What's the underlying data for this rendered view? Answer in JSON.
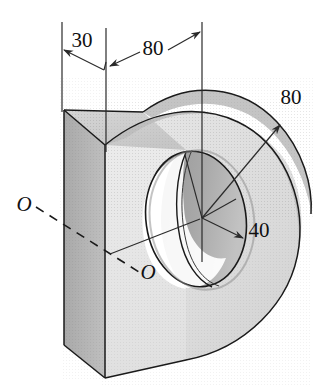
{
  "figure": {
    "name": "isometric-d-plate-with-through-hole",
    "background_color": "#ffffff",
    "width": 323,
    "height": 389
  },
  "dimensions": [
    {
      "id": "thickness",
      "label": "30",
      "x": 82,
      "y": 47,
      "kind": "linear-top"
    },
    {
      "id": "length",
      "label": "80",
      "x": 153,
      "y": 55,
      "kind": "linear-top"
    },
    {
      "id": "outer_radius",
      "label": "80",
      "x": 291,
      "y": 104,
      "kind": "radius"
    },
    {
      "id": "hole_radius",
      "label": "40",
      "x": 259,
      "y": 237,
      "kind": "radius"
    }
  ],
  "axis_labels": [
    {
      "id": "axis-o-left",
      "label": "O",
      "x": 24,
      "y": 211
    },
    {
      "id": "axis-o-right",
      "label": "O",
      "x": 148,
      "y": 279
    }
  ],
  "colors": {
    "front_face": "#e8e8e8",
    "top_face": "#d0d0d0",
    "side_face": "#b0b0b0",
    "bore_dark": "#9a9a9a",
    "bore_light": "#ffffff",
    "lobe_face": "#dcdcdc",
    "outline": "#1a1a1a",
    "dim_line": "#2a2a2a"
  },
  "geometry": {
    "hole_center": {
      "x": 202,
      "y": 218
    },
    "block_top_left": {
      "x": 64,
      "y": 110
    },
    "block_bottom_front": {
      "x": 105,
      "y": 378
    }
  }
}
